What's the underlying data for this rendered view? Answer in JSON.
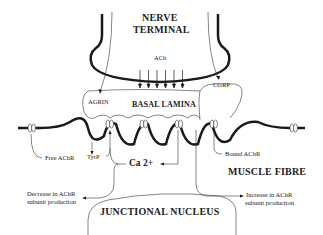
{
  "diagram": {
    "type": "neuromuscular-junction schematic",
    "labels": {
      "nerve_terminal_line1": "NERVE",
      "nerve_terminal_line2": "TERMINAL",
      "ach": "ACh",
      "agrin": "AGRIN",
      "cgrp": "CGRP",
      "basal_lamina": "BASAL LAMINA",
      "free_achr": "Free AChR",
      "tyrp": "TyrP",
      "bound_achr": "Bound AChR",
      "calcium": "Ca 2+",
      "muscle_fibre": "MUSCLE FIBRE",
      "decrease_line1": "Decrease in AChR",
      "decrease_line2": "subunit production",
      "increase_line1": "Increase in AChR",
      "increase_line2": "subunit production",
      "junctional_nucleus": "JUNCTIONAL NUCLEUS"
    },
    "colors": {
      "line": "#1a1a1a",
      "background": "#ffffff"
    }
  }
}
